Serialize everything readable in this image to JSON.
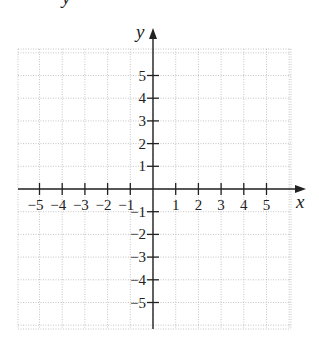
{
  "chart_data": {
    "type": "coordinate_grid",
    "title": "",
    "xlabel": "x",
    "ylabel": "y",
    "xlim": [
      -5.5,
      5.5
    ],
    "ylim": [
      -5.5,
      5.5
    ],
    "grid": true,
    "x_ticks": [
      -5,
      -4,
      -3,
      -2,
      -1,
      1,
      2,
      3,
      4,
      5
    ],
    "y_ticks": [
      5,
      4,
      3,
      2,
      1,
      -1,
      -2,
      -3,
      -4,
      -5
    ],
    "x_tick_labels": [
      "−5",
      "−4",
      "−3",
      "−2",
      "−1",
      "1",
      "2",
      "3",
      "4",
      "5"
    ],
    "y_tick_labels": [
      "5",
      "4",
      "3",
      "2",
      "1",
      "−1",
      "−2",
      "−3",
      "−4",
      "−5"
    ],
    "series": []
  },
  "labels": {
    "x_axis": "x",
    "y_axis": "y",
    "top_fragment": "y"
  }
}
